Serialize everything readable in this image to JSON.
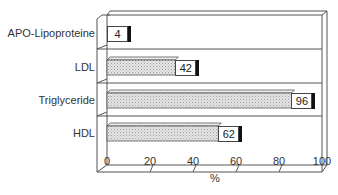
{
  "chart_data": {
    "type": "bar",
    "orientation": "horizontal",
    "style": "3d",
    "title": "",
    "xlabel": "%",
    "ylabel": "",
    "categories": [
      "APO-Lipoproteine",
      "LDL",
      "Triglyceride",
      "HDL"
    ],
    "values": [
      4,
      42,
      96,
      62
    ],
    "xlim": [
      0,
      100
    ],
    "xticks": [
      "0",
      "20",
      "40",
      "60",
      "80",
      "100"
    ],
    "grid": false,
    "legend": null,
    "bar_fill": "#d8d8d8",
    "frame_color": "#555555"
  }
}
